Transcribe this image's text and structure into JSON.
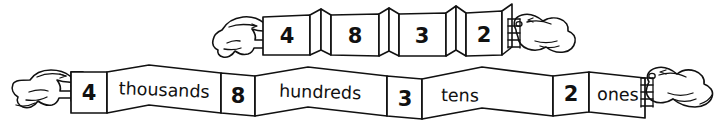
{
  "figure": {
    "ink_color": "#111111",
    "paper_color": "#ffffff"
  },
  "folded_strip": {
    "label": "folded-strip",
    "description": "Accordion-folded strip held between two hands, showing only the digits",
    "digits": [
      "4",
      "8",
      "3",
      "2"
    ],
    "hand_left": "left-hand-pinch",
    "hand_right": "right-hand-pinch"
  },
  "unfolded_strip": {
    "label": "unfolded-strip",
    "description": "Strip pulled open between two hands, showing digits and place-value words",
    "cells": [
      {
        "kind": "digit",
        "text": "4"
      },
      {
        "kind": "word",
        "text": "thousands"
      },
      {
        "kind": "digit",
        "text": "8"
      },
      {
        "kind": "word",
        "text": "hundreds"
      },
      {
        "kind": "digit",
        "text": "3"
      },
      {
        "kind": "word",
        "text": "tens"
      },
      {
        "kind": "digit",
        "text": "2"
      },
      {
        "kind": "word",
        "text": "ones"
      }
    ],
    "hand_left": "left-hand-grip",
    "hand_right": "right-hand-grip"
  },
  "number": {
    "value": "4832",
    "expanded": "4 thousands 8 hundreds 3 tens 2 ones"
  }
}
